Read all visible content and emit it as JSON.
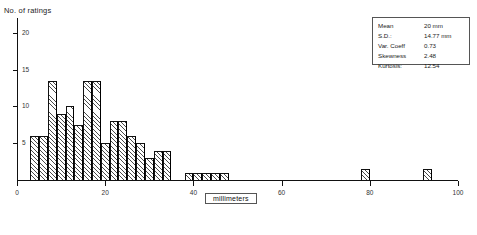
{
  "chart_data": {
    "type": "bar",
    "title": "",
    "subtitle": "",
    "xlabel": "millimeters",
    "ylabel": "No. of ratings",
    "xlim": [
      0,
      100
    ],
    "ylim": [
      0,
      22
    ],
    "xticks": [
      0,
      20,
      40,
      60,
      80,
      100
    ],
    "xtick_labels": [
      "0",
      "20",
      "40",
      "60",
      "80",
      "100"
    ],
    "yticks": [
      5,
      10,
      15,
      20
    ],
    "ytick_labels": [
      "5",
      "10",
      "15",
      "20"
    ],
    "grid": false,
    "legend": "none",
    "bin_width": 2,
    "bar_style": "hatched-diagonal",
    "bins": [
      {
        "x0": 3,
        "x1": 5,
        "value": 6
      },
      {
        "x0": 5,
        "x1": 7,
        "value": 6
      },
      {
        "x0": 7,
        "x1": 9,
        "value": 13.5
      },
      {
        "x0": 9,
        "x1": 11,
        "value": 9
      },
      {
        "x0": 11,
        "x1": 13,
        "value": 10
      },
      {
        "x0": 13,
        "x1": 15,
        "value": 7.5
      },
      {
        "x0": 15,
        "x1": 17,
        "value": 13.5
      },
      {
        "x0": 17,
        "x1": 19,
        "value": 13.5
      },
      {
        "x0": 19,
        "x1": 21,
        "value": 5
      },
      {
        "x0": 21,
        "x1": 23,
        "value": 8
      },
      {
        "x0": 23,
        "x1": 25,
        "value": 8
      },
      {
        "x0": 25,
        "x1": 27,
        "value": 6
      },
      {
        "x0": 27,
        "x1": 29,
        "value": 5
      },
      {
        "x0": 29,
        "x1": 31,
        "value": 3
      },
      {
        "x0": 31,
        "x1": 33,
        "value": 4
      },
      {
        "x0": 33,
        "x1": 35,
        "value": 4
      },
      {
        "x0": 38,
        "x1": 40,
        "value": 1
      },
      {
        "x0": 40,
        "x1": 42,
        "value": 1
      },
      {
        "x0": 42,
        "x1": 44,
        "value": 1
      },
      {
        "x0": 44,
        "x1": 46,
        "value": 1
      },
      {
        "x0": 46,
        "x1": 48,
        "value": 1
      },
      {
        "x0": 78,
        "x1": 80,
        "value": 1.5
      },
      {
        "x0": 92,
        "x1": 94,
        "value": 1.5
      }
    ]
  },
  "stats": {
    "rows": [
      {
        "label": "Mean",
        "value": "20 mm"
      },
      {
        "label": "S.D.:",
        "value": "14.77 mm"
      },
      {
        "label": "Var. Coeff",
        "value": "0.73"
      },
      {
        "label": "Skewness",
        "value": "2.48"
      },
      {
        "label": "Kurtosis:",
        "value": "12.54"
      }
    ]
  }
}
